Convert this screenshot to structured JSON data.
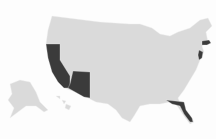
{
  "map": {
    "title": "United States",
    "base_color": "#dadada",
    "highlight_color": "#3b3b3b",
    "background_color": "#fdfdfd",
    "highlighted_states": [
      "California",
      "Arizona",
      "Florida",
      "New Jersey",
      "Massachusetts"
    ]
  }
}
